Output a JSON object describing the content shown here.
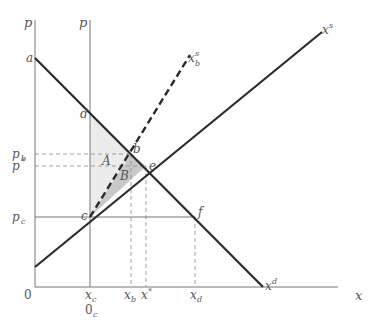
{
  "diagram": {
    "type": "supply-demand-welfare",
    "colors": {
      "axis": "#777777",
      "curve": "#2a2a2a",
      "dashed_guide": "#888888",
      "region_A_fill": "#ececec",
      "region_B_fill": "#c8c8c8",
      "label": "#555555"
    },
    "axes": {
      "origin_label": "0",
      "x_axis_label": "x",
      "y_axis_label_left": "p",
      "y_axis_label_right": "p",
      "secondary_origin_label": "0",
      "secondary_origin_sub": "c"
    },
    "price_ticks": [
      {
        "name": "p",
        "sub": "b"
      },
      {
        "name": "p",
        "sup": "*"
      },
      {
        "name": "p",
        "sub": "c"
      }
    ],
    "quantity_ticks": [
      {
        "name": "x",
        "sub": "c"
      },
      {
        "name": "x",
        "sub": "b"
      },
      {
        "name": "x",
        "sup": "*"
      },
      {
        "name": "x",
        "sub": "d"
      }
    ],
    "curves": [
      {
        "id": "demand",
        "label": "x",
        "sup": "d",
        "style": "solid"
      },
      {
        "id": "supply",
        "label": "x",
        "sup": "s",
        "style": "solid"
      },
      {
        "id": "bank-supply",
        "label": "x",
        "sub": "b",
        "sup": "s",
        "style": "dashed"
      }
    ],
    "points": [
      "a",
      "b",
      "c",
      "d",
      "e",
      "f"
    ],
    "regions": [
      "A",
      "B"
    ]
  }
}
